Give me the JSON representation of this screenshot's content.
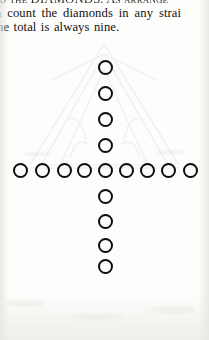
{
  "page": {
    "width": 209,
    "height": 340,
    "background_color": "#fdfdfc",
    "ink_color": "#141210"
  },
  "text": {
    "line_1_partial": "ed the DIAMONDS. As arrange",
    "line_2_partial": "n count the diamonds in any strai",
    "line_3_partial": "he total is always nine."
  },
  "figure": {
    "name": "nine-diamonds-cross",
    "row_count": 9,
    "column_count": 9,
    "total_visible_circles": 17,
    "circle_outline_color": "#100e0c",
    "circle_diameter_px": 15,
    "circle_stroke_px": 2.1,
    "row_center_y": 170,
    "column_center_x": 105,
    "row_circles_cx": [
      20,
      42,
      64,
      84,
      105,
      126,
      147,
      168,
      190
    ],
    "column_circles_cy": [
      67,
      93,
      119,
      145,
      170,
      196,
      221,
      245,
      266
    ]
  },
  "ghost_artwork": {
    "name": "show-through-tent-outline",
    "description": "Faint bleed-through line art from the reverse side of the page",
    "opacity": 0.085,
    "color": "#7a766e"
  }
}
